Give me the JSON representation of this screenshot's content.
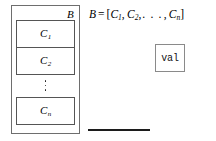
{
  "diagram": {
    "background_color": "#ffffff",
    "ink_color": "#000000",
    "block": {
      "label": "B",
      "border_color": "#6e6e6e",
      "chunks": [
        {
          "base": "C",
          "subscript": "1",
          "name": "chunk-c1"
        },
        {
          "base": "C",
          "subscript": "2",
          "name": "chunk-c2"
        },
        {
          "base": "C",
          "subscript": "n",
          "name": "chunk-cn"
        }
      ],
      "ellipsis_dots": 3
    },
    "equation": {
      "lhs": "B",
      "operator": "=",
      "open_bracket": "[",
      "terms": [
        {
          "base": "C",
          "subscript": "1"
        },
        {
          "base": "C",
          "subscript": "2"
        }
      ],
      "separator": ",",
      "ellipsis": ". . .",
      "last_term": {
        "base": "C",
        "subscript": "n"
      },
      "close_bracket": "]",
      "full_text": "B = [C1, C2, . . . , Cn]"
    },
    "value_box": {
      "label": "val",
      "border_color": "#8a8a8a",
      "font": "monospace"
    },
    "rule": {
      "name": "horizontal-rule",
      "color": "#1c1c1c"
    }
  }
}
